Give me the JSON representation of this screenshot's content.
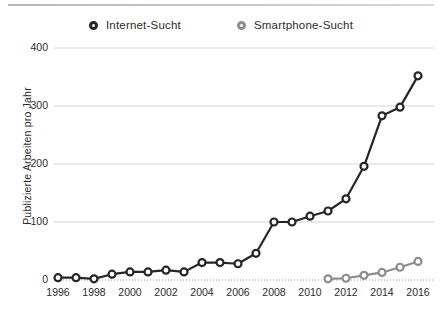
{
  "legend": {
    "position": "top-center",
    "items": [
      {
        "label": "Internet-Sucht",
        "color": "#262626",
        "marker": "circle-open"
      },
      {
        "label": "Smartphone-Sucht",
        "color": "#8d8d8d",
        "marker": "circle-open"
      }
    ]
  },
  "axes": {
    "ylabel": "Publizierte Arbeiten pro Jahr",
    "xlabel": "",
    "yticks": [
      0,
      100,
      200,
      300,
      400
    ],
    "ytick_labels": [
      "0",
      "100",
      "200",
      "300",
      "400"
    ],
    "xticks": [
      1996,
      1998,
      2000,
      2002,
      2004,
      2006,
      2008,
      2010,
      2012,
      2014,
      2016
    ],
    "xtick_labels": [
      "1996",
      "1998",
      "2000",
      "2002",
      "2004",
      "2006",
      "2008",
      "2010",
      "2012",
      "2014",
      "2016"
    ]
  },
  "chart_data": {
    "type": "line",
    "title": "",
    "xlabel": "",
    "ylabel": "Publizierte Arbeiten pro Jahr",
    "xlim": [
      1996,
      2016
    ],
    "ylim": [
      0,
      400
    ],
    "grid": "horizontal",
    "x": [
      1996,
      1997,
      1998,
      1999,
      2000,
      2001,
      2002,
      2003,
      2004,
      2005,
      2006,
      2007,
      2008,
      2009,
      2010,
      2011,
      2012,
      2013,
      2014,
      2015,
      2016
    ],
    "series": [
      {
        "name": "Internet-Sucht",
        "color": "#262626",
        "marker": "circle-open",
        "values": [
          4,
          4,
          2,
          10,
          14,
          14,
          17,
          14,
          30,
          30,
          28,
          46,
          100,
          100,
          110,
          119,
          140,
          196,
          283,
          298,
          352
        ]
      },
      {
        "name": "Smartphone-Sucht",
        "color": "#8d8d8d",
        "marker": "circle-open",
        "values": [
          null,
          null,
          null,
          null,
          null,
          null,
          null,
          null,
          null,
          null,
          null,
          null,
          null,
          null,
          null,
          2,
          3,
          8,
          13,
          22,
          32
        ]
      }
    ]
  },
  "colors": {
    "internet": "#262626",
    "smartphone": "#8d8d8d",
    "grid": "#d4d4d4",
    "axis_rule": "#bfbfbf",
    "text": "#2b2b2b"
  }
}
